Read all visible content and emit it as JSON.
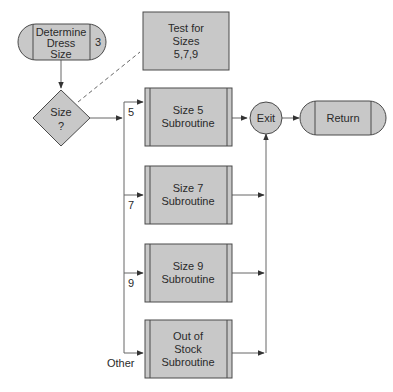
{
  "colors": {
    "fill": "#c8c8c8",
    "stroke": "#4a4a4a",
    "line": "#666666",
    "text": "#2a2a2a"
  },
  "nodes": {
    "start": {
      "lines": [
        "Determine",
        "Dress",
        "Size"
      ],
      "page_ref": "3"
    },
    "annotation": {
      "lines": [
        "Test for",
        "Sizes",
        "5,7,9"
      ]
    },
    "decision": {
      "lines": [
        "Size",
        "?"
      ]
    },
    "size5": {
      "lines": [
        "Size 5",
        "Subroutine"
      ]
    },
    "size7": {
      "lines": [
        "Size 7",
        "Subroutine"
      ]
    },
    "size9": {
      "lines": [
        "Size 9",
        "Subroutine"
      ]
    },
    "other": {
      "lines": [
        "Out of",
        "Stock",
        "Subroutine"
      ]
    },
    "exit": {
      "label": "Exit"
    },
    "return": {
      "label": "Return"
    }
  },
  "branch_labels": {
    "five": "5",
    "seven": "7",
    "nine": "9",
    "other": "Other"
  }
}
